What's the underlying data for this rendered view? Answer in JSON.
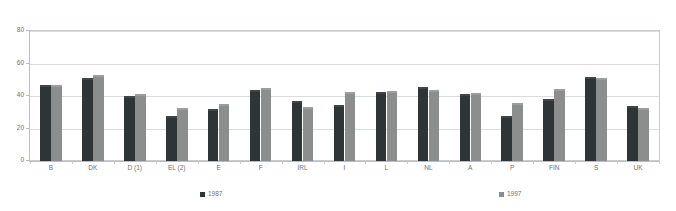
{
  "top_note": "",
  "legend": {
    "position": "bottom",
    "items": [
      {
        "label": "1987",
        "color": "#2f3436",
        "swatch_icon": "square-swatch-icon"
      },
      {
        "label": "1997",
        "color": "#8b8e8d",
        "swatch_icon": "square-swatch-icon"
      }
    ]
  },
  "chart_data": {
    "type": "bar",
    "title": "",
    "subtitle": "",
    "xlabel": "",
    "ylabel": "",
    "ylim": [
      0,
      80
    ],
    "yticks": [
      0,
      20,
      40,
      60,
      80
    ],
    "ytick_labels": [
      "0",
      "20",
      "40",
      "60",
      "80"
    ],
    "grid": true,
    "grid_axis": "y",
    "categories": [
      "B",
      "DK",
      "D (1)",
      "EL (2)",
      "E",
      "F",
      "IRL",
      "I",
      "L",
      "NL",
      "A",
      "P",
      "FIN",
      "S",
      "UK"
    ],
    "series": [
      {
        "name": "1987",
        "color": "#2f3436",
        "values": [
          46.5,
          51,
          40,
          27.5,
          32,
          43.5,
          37,
          34.5,
          42.5,
          45.5,
          41,
          27.5,
          38,
          51.5,
          34
        ]
      },
      {
        "name": "1997",
        "color": "#8b8e8d",
        "values": [
          46.5,
          53,
          41,
          32.5,
          35,
          45,
          33,
          42.5,
          43,
          44,
          42,
          35.5,
          44.5,
          51,
          32.5
        ]
      }
    ]
  }
}
